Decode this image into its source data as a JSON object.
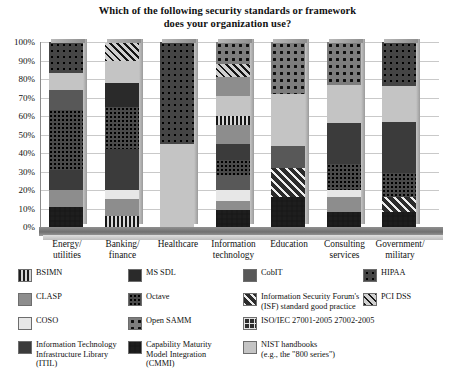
{
  "chart_data": {
    "type": "bar",
    "title": "Which of the following security standards or framework does your organization use?",
    "title_line1": "Which of the following security standards or framework",
    "title_line2": "does your organization use?",
    "xlabel": "",
    "ylabel": "",
    "ylim": [
      0,
      100
    ],
    "grid": true,
    "stacked": true,
    "legend_position": "bottom",
    "ytick_labels": [
      "100%",
      "90%",
      "80%",
      "70%",
      "60%",
      "50%",
      "40%",
      "30%",
      "20%",
      "10%",
      "0%"
    ],
    "ytick_values": [
      100,
      90,
      80,
      70,
      60,
      50,
      40,
      30,
      20,
      10,
      0
    ],
    "categories": [
      "Energy/\nutilities",
      "Banking/\nfinance",
      "Healthcare",
      "Information\ntechnology",
      "Education",
      "Consulting\nservices",
      "Government/\nmilitary"
    ],
    "categories_flat": [
      "Energy/ utilities",
      "Banking/ finance",
      "Healthcare",
      "Information technology",
      "Education",
      "Consulting services",
      "Government/ military"
    ],
    "series": [
      {
        "name": "BSIMN",
        "pattern": "vstripe",
        "values": [
          11,
          0,
          0,
          0,
          0,
          0,
          0
        ]
      },
      {
        "name": "CLASP",
        "pattern": "midGray",
        "values": [
          9,
          9,
          0,
          5,
          0,
          8,
          0
        ]
      },
      {
        "name": "COSO",
        "pattern": "veryLight",
        "values": [
          0,
          5,
          0,
          6,
          0,
          4,
          0
        ]
      },
      {
        "name": "Information Technology Infrastructure Library (ITIL)",
        "pattern": "solidDark",
        "values": [
          11,
          33,
          0,
          9,
          0,
          28,
          28
        ]
      },
      {
        "name": "MS SDL",
        "pattern": "solidDarker",
        "values": [
          0,
          0,
          0,
          5,
          0,
          0,
          0
        ]
      },
      {
        "name": "Octave",
        "pattern": "finedots",
        "values": [
          32,
          23,
          0,
          8,
          0,
          14,
          13
        ]
      },
      {
        "name": "Open SAMM",
        "pattern": "bigdots",
        "values": [
          0,
          0,
          45,
          0,
          40,
          0,
          0
        ]
      },
      {
        "name": "Capability Maturity Model Integration (CMMI)",
        "pattern": "checker",
        "values": [
          0,
          0,
          0,
          9,
          16,
          0,
          0
        ]
      },
      {
        "name": "CobIT",
        "pattern": "darkGray",
        "values": [
          0,
          0,
          0,
          0,
          0,
          0,
          0
        ]
      },
      {
        "name": "Information Security Forum's (ISF) standard good practice",
        "pattern": "diag",
        "values": [
          0,
          0,
          0,
          0,
          16,
          0,
          8
        ]
      },
      {
        "name": "ISO/IEC 27001-2005 27002-2005",
        "pattern": "isogrid",
        "values": [
          0,
          0,
          0,
          5,
          0,
          0,
          0
        ]
      },
      {
        "name": "NIST handbooks (e.g., the \"800 series\")",
        "pattern": "lightGray",
        "values": [
          9,
          0,
          0,
          11,
          28,
          23,
          24
        ]
      },
      {
        "name": "HIPAA",
        "pattern": "dotsdark",
        "values": [
          28,
          25,
          55,
          20,
          0,
          23,
          27
        ]
      },
      {
        "name": "PCI DSS",
        "pattern": "diagLight",
        "values": [
          0,
          5,
          0,
          5,
          0,
          0,
          0
        ]
      }
    ],
    "bars": [
      {
        "category": "Energy/ utilities",
        "segments": [
          {
            "pattern": "checker",
            "value": 11
          },
          {
            "pattern": "midGray",
            "value": 9
          },
          {
            "pattern": "solidDark",
            "value": 11
          },
          {
            "pattern": "finedots",
            "value": 32
          },
          {
            "pattern": "darkGray",
            "value": 11
          },
          {
            "pattern": "lightGray",
            "value": 9
          },
          {
            "pattern": "dotsdark",
            "value": 17
          }
        ]
      },
      {
        "category": "Banking/ finance",
        "segments": [
          {
            "pattern": "vticks",
            "value": 6
          },
          {
            "pattern": "midGray",
            "value": 9
          },
          {
            "pattern": "veryLight",
            "value": 5
          },
          {
            "pattern": "solidDark",
            "value": 22
          },
          {
            "pattern": "finedots",
            "value": 23
          },
          {
            "pattern": "solidDarker",
            "value": 13
          },
          {
            "pattern": "lightGray",
            "value": 12
          },
          {
            "pattern": "diagLight",
            "value": 10
          }
        ]
      },
      {
        "category": "Healthcare",
        "segments": [
          {
            "pattern": "lightGray",
            "value": 45
          },
          {
            "pattern": "dotsdark",
            "value": 55
          }
        ]
      },
      {
        "category": "Information technology",
        "segments": [
          {
            "pattern": "checker",
            "value": 9
          },
          {
            "pattern": "midGray",
            "value": 5
          },
          {
            "pattern": "veryLight",
            "value": 6
          },
          {
            "pattern": "darkGray",
            "value": 8
          },
          {
            "pattern": "finedots",
            "value": 8
          },
          {
            "pattern": "solidDark",
            "value": 9
          },
          {
            "pattern": "midGray",
            "value": 10
          },
          {
            "pattern": "vticks",
            "value": 5
          },
          {
            "pattern": "lightGray",
            "value": 11
          },
          {
            "pattern": "midGray",
            "value": 10
          },
          {
            "pattern": "diagLight",
            "value": 7
          },
          {
            "pattern": "bigdots",
            "value": 12
          }
        ]
      },
      {
        "category": "Education",
        "segments": [
          {
            "pattern": "checker",
            "value": 16
          },
          {
            "pattern": "diag",
            "value": 16
          },
          {
            "pattern": "darkGray",
            "value": 12
          },
          {
            "pattern": "lightGray",
            "value": 28
          },
          {
            "pattern": "bigdots",
            "value": 28
          }
        ]
      },
      {
        "category": "Consulting services",
        "segments": [
          {
            "pattern": "checker",
            "value": 8
          },
          {
            "pattern": "midGray",
            "value": 8
          },
          {
            "pattern": "veryLight",
            "value": 4
          },
          {
            "pattern": "finedots",
            "value": 14
          },
          {
            "pattern": "solidDark",
            "value": 22
          },
          {
            "pattern": "lightGray",
            "value": 21
          },
          {
            "pattern": "bigdots",
            "value": 23
          }
        ]
      },
      {
        "category": "Government/ military",
        "segments": [
          {
            "pattern": "checker",
            "value": 8
          },
          {
            "pattern": "diag",
            "value": 8
          },
          {
            "pattern": "finedots",
            "value": 13
          },
          {
            "pattern": "solidDark",
            "value": 28
          },
          {
            "pattern": "lightGray",
            "value": 19
          },
          {
            "pattern": "dotsdark",
            "value": 24
          }
        ]
      }
    ],
    "legend": [
      {
        "label": "BSIMN",
        "pattern": "vstripe",
        "col": 0,
        "row": 0
      },
      {
        "label": "CLASP",
        "pattern": "midGray",
        "col": 0,
        "row": 1
      },
      {
        "label": "COSO",
        "pattern": "veryLight",
        "col": 0,
        "row": 2
      },
      {
        "label": "Information Technology\nInfrastructure Library\n(ITIL)",
        "pattern": "solidDark",
        "col": 0,
        "row": 3
      },
      {
        "label": "MS SDL",
        "pattern": "solidDarker",
        "col": 1,
        "row": 0
      },
      {
        "label": "Octave",
        "pattern": "finedots",
        "col": 1,
        "row": 1
      },
      {
        "label": "Open SAMM",
        "pattern": "bigdots",
        "col": 1,
        "row": 2
      },
      {
        "label": "Capability Maturity\nModel Integration\n(CMMI)",
        "pattern": "checker",
        "col": 1,
        "row": 3
      },
      {
        "label": "CobIT",
        "pattern": "darkGray",
        "col": 2,
        "row": 0
      },
      {
        "label": "Information Security Forum's\n(ISF) standard good practice",
        "pattern": "diag",
        "col": 2,
        "row": 1
      },
      {
        "label": "ISO/IEC 27001-2005 27002-2005",
        "pattern": "isogrid",
        "col": 2,
        "row": 2
      },
      {
        "label": "NIST handbooks\n(e.g., the \"800 series\")",
        "pattern": "lightGray",
        "col": 2,
        "row": 3
      },
      {
        "label": "HIPAA",
        "pattern": "dotsdark",
        "col": 3,
        "row": 0
      },
      {
        "label": "PCI DSS",
        "pattern": "diagLight",
        "col": 3,
        "row": 1
      }
    ],
    "colors": {
      "solidDark": "#3b3b3b",
      "solidDarker": "#2a2a2a",
      "midGray": "#8d8d8d",
      "lightGray": "#c4c4c4",
      "veryLight": "#e7e7e7",
      "darkGray": "#585858",
      "background": "#ffffff",
      "gridline": "#c9c9c9",
      "text": "#111111"
    }
  }
}
